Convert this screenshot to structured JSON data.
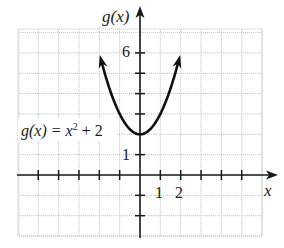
{
  "chart_data": {
    "type": "line",
    "title": "",
    "function_label": "g(x) = x² + 2",
    "function_label_parts": {
      "lhs": "g(x) = x",
      "exp": "2",
      "rhs": " + 2"
    },
    "xlabel": "x",
    "ylabel": "g(x)",
    "xlim": [
      -6,
      6
    ],
    "ylim": [
      -3,
      7
    ],
    "grid": true,
    "x_tick_labels": [
      "1",
      "2"
    ],
    "y_tick_labels": [
      "1",
      "6"
    ],
    "x_ticks": [
      -5,
      -4,
      -3,
      -2,
      -1,
      1,
      2,
      3,
      4,
      5
    ],
    "y_ticks": [
      -2,
      -1,
      1,
      2,
      3,
      4,
      5,
      6
    ],
    "series": [
      {
        "name": "g(x) = x^2 + 2",
        "x": [
          -1.9,
          -1.5,
          -1,
          -0.5,
          0,
          0.5,
          1,
          1.5,
          1.9
        ],
        "y": [
          5.61,
          4.25,
          3,
          2.25,
          2,
          2.25,
          3,
          4.25,
          5.61
        ]
      }
    ],
    "vertex": [
      0,
      2
    ],
    "arrows_at_ends": true
  },
  "colors": {
    "curve": "#111111",
    "axis": "#1a1a1a",
    "grid": "#c8c8c8",
    "background": "#ffffff"
  }
}
